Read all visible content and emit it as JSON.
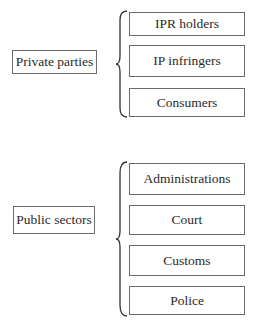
{
  "groups": [
    {
      "label": "Private parties",
      "members": [
        "IPR holders",
        "IP infringers",
        "Consumers"
      ]
    },
    {
      "label": "Public sectors",
      "members": [
        "Administrations",
        "Court",
        "Customs",
        "Police"
      ]
    }
  ]
}
